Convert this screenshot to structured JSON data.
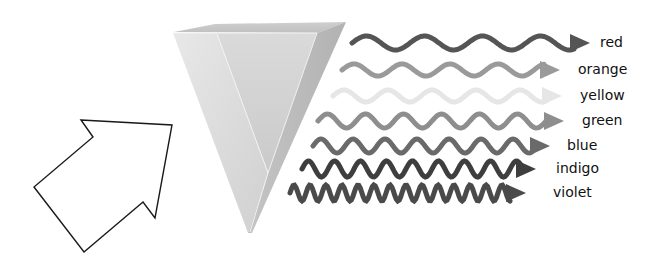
{
  "diagram": {
    "title": "",
    "input_arrow": {
      "label": "",
      "icon": "outline-arrow-icon",
      "stroke": "#1a1a1a",
      "fill": "#ffffff"
    },
    "prism": {
      "icon": "triangular-prism-icon",
      "face_light": "#e4e4e4",
      "face_mid": "#d2d2d2",
      "face_dark": "#bdbdbd"
    },
    "spectrum": [
      {
        "name": "red",
        "label": "red",
        "color": "#555555",
        "y": 43,
        "wavelength": 58,
        "amplitude": 7,
        "stroke": 5,
        "x_start": 352,
        "x_end": 574,
        "label_x": 600
      },
      {
        "name": "orange",
        "label": "orange",
        "color": "#9a9a9a",
        "y": 70,
        "wavelength": 48,
        "amplitude": 6,
        "stroke": 5,
        "x_start": 342,
        "x_end": 544,
        "label_x": 578
      },
      {
        "name": "yellow",
        "label": "yellow",
        "color": "#e6e6e6",
        "y": 96,
        "wavelength": 44,
        "amplitude": 6,
        "stroke": 5,
        "x_start": 333,
        "x_end": 546,
        "label_x": 580
      },
      {
        "name": "green",
        "label": "green",
        "color": "#8e8e8e",
        "y": 121,
        "wavelength": 38,
        "amplitude": 7,
        "stroke": 5,
        "x_start": 318,
        "x_end": 548,
        "label_x": 582
      },
      {
        "name": "blue",
        "label": "blue",
        "color": "#6a6a6a",
        "y": 146,
        "wavelength": 32,
        "amplitude": 7,
        "stroke": 5,
        "x_start": 313,
        "x_end": 534,
        "label_x": 567
      },
      {
        "name": "indigo",
        "label": "indigo",
        "color": "#3e3e3e",
        "y": 169,
        "wavelength": 26,
        "amplitude": 8,
        "stroke": 5,
        "x_start": 302,
        "x_end": 520,
        "label_x": 556
      },
      {
        "name": "violet",
        "label": "violet",
        "color": "#4a4a4a",
        "y": 193,
        "wavelength": 16,
        "amplitude": 8,
        "stroke": 5,
        "x_start": 290,
        "x_end": 510,
        "label_x": 553
      }
    ]
  }
}
